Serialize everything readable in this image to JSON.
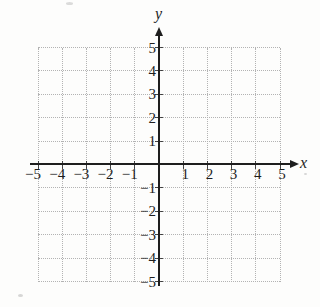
{
  "chart_data": {
    "type": "scatter",
    "title": "",
    "xlabel": "x",
    "ylabel": "y",
    "xlim": [
      -5,
      5
    ],
    "ylim": [
      -5,
      5
    ],
    "x_ticks": [
      -5,
      -4,
      -3,
      -2,
      -1,
      1,
      2,
      3,
      4,
      5
    ],
    "y_ticks": [
      -5,
      -4,
      -3,
      -2,
      -1,
      1,
      2,
      3,
      4,
      5
    ],
    "grid": "dotted",
    "legend": "none",
    "series": []
  },
  "colors": {
    "background": "#fdfdfc",
    "grid": "#b3b3b3",
    "axis": "#1e1e1e",
    "text": "#1e1e1e"
  }
}
